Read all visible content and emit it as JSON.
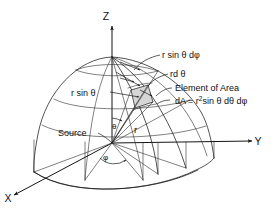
{
  "figure": {
    "background_color": "#ffffff",
    "line_color": "#1a1a1a",
    "patch_fill_color": "#d6d6d6",
    "width": 274,
    "height": 213
  },
  "axes": {
    "z_label": "Z",
    "y_label": "Y",
    "x_label": "X"
  },
  "labels": {
    "r_sin_theta": "r sin θ",
    "r_sin_theta_dphi": "r sin θ dφ",
    "r_dtheta": "rd θ",
    "element_of_area": "Element of Area",
    "area_formula_prefix": "dA = r",
    "area_formula_exponent": "2",
    "area_formula_suffix": "sin θ dθ dφ",
    "source": "Source",
    "radius": "r",
    "theta": "θ",
    "phi": "φ"
  },
  "caption": {
    "text": ""
  }
}
